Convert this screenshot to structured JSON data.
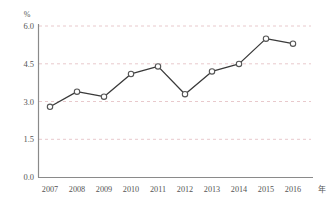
{
  "chart_data": {
    "type": "line",
    "title": "",
    "xlabel": "年",
    "ylabel": "%",
    "categories": [
      "2007",
      "2008",
      "2009",
      "2010",
      "2011",
      "2012",
      "2013",
      "2014",
      "2015",
      "2016"
    ],
    "values": [
      2.8,
      3.4,
      3.2,
      4.1,
      4.4,
      3.3,
      4.2,
      4.5,
      5.5,
      5.3
    ],
    "series": [
      {
        "name": "",
        "values": [
          2.8,
          3.4,
          3.2,
          4.1,
          4.4,
          3.3,
          4.2,
          4.5,
          5.5,
          5.3
        ]
      }
    ],
    "ylim": [
      0.0,
      6.0
    ],
    "yticks": [
      "0.0",
      "1.5",
      "3.0",
      "4.5",
      "6.0"
    ],
    "ytick_values": [
      0.0,
      1.5,
      3.0,
      4.5,
      6.0
    ],
    "grid": true,
    "grid_style": "dashed-horizontal",
    "legend": "none",
    "marker": "open-circle",
    "colors": {
      "line": "#3a3a3a",
      "marker_fill": "#ffffff",
      "marker_stroke": "#555555",
      "grid": "#e8c9cc",
      "axis": "#7a7a7a",
      "text": "#555555",
      "background": "#ffffff"
    }
  },
  "axis": {
    "y_unit_label": "%",
    "x_unit_label": "年",
    "y_tick_labels": [
      "6.0",
      "4.5",
      "3.0",
      "1.5",
      "0.0"
    ],
    "x_tick_labels": [
      "2007",
      "2008",
      "2009",
      "2010",
      "2011",
      "2012",
      "2013",
      "2014",
      "2015",
      "2016"
    ]
  }
}
